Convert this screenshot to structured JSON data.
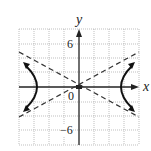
{
  "figure": {
    "type": "hyperbola-graph",
    "x_axis_label": "x",
    "y_axis_label": "y",
    "tick_labels": {
      "y_top": "6",
      "y_bottom": "−6",
      "origin": "0"
    },
    "grid": {
      "x_min": -8,
      "x_max": 8,
      "y_min": -8,
      "y_max": 8,
      "step": 2
    },
    "curve": "hyperbola opening left and right",
    "asymptotes": "two dashed lines through origin",
    "colors": {
      "grid": "#9a9a9a",
      "axis": "#222222",
      "curve": "#111111"
    }
  }
}
